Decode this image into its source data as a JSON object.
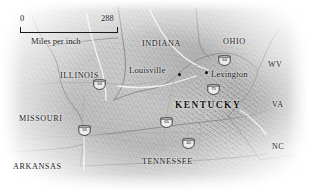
{
  "map": {
    "title": "Kentucky regional relief map",
    "scale_bar": {
      "min_label": "0",
      "max_label": "288",
      "caption": "Miles per inch"
    },
    "states": [
      {
        "id": "illinois",
        "label": "ILLINOIS",
        "x": 60,
        "y": 72
      },
      {
        "id": "indiana",
        "label": "INDIANA",
        "x": 142,
        "y": 40
      },
      {
        "id": "ohio",
        "label": "OHIO",
        "x": 223,
        "y": 38
      },
      {
        "id": "wv",
        "label": "WV",
        "x": 268,
        "y": 61
      },
      {
        "id": "va",
        "label": "VA",
        "x": 272,
        "y": 101
      },
      {
        "id": "nc",
        "label": "NC",
        "x": 272,
        "y": 143
      },
      {
        "id": "missouri",
        "label": "MISSOURI",
        "x": 19,
        "y": 115
      },
      {
        "id": "arkansas",
        "label": "ARKANSAS",
        "x": 13,
        "y": 163
      },
      {
        "id": "tennessee",
        "label": "TENNESSEE",
        "x": 142,
        "y": 158
      }
    ],
    "focus_state": {
      "id": "kentucky",
      "label": "KENTUCKY",
      "x": 175,
      "y": 101
    },
    "cities": [
      {
        "id": "louisville",
        "label": "Louisville",
        "label_x": 129,
        "label_y": 66,
        "dot_x": 178,
        "dot_y": 73
      },
      {
        "id": "lexington",
        "label": "Lexington",
        "label_x": 211,
        "label_y": 70,
        "dot_x": 205,
        "dot_y": 71
      }
    ],
    "interstate_shields": [
      {
        "id": "i64-illinois",
        "number": "64",
        "x": 93,
        "y": 79
      },
      {
        "id": "i64-kentucky",
        "number": "64",
        "x": 218,
        "y": 55
      },
      {
        "id": "i75-kentucky",
        "number": "75",
        "x": 207,
        "y": 84
      },
      {
        "id": "i65-kentucky",
        "number": "65",
        "x": 160,
        "y": 117
      },
      {
        "id": "i55-missouri",
        "number": "55",
        "x": 78,
        "y": 125
      },
      {
        "id": "i40-tennessee",
        "number": "40",
        "x": 182,
        "y": 138
      }
    ],
    "colors": {
      "land": "#c6c6c6",
      "ink": "#1d1d1d",
      "border_line": "#8a8a8a",
      "river": "#ffffff",
      "shield_fill": "#e9e9e9"
    }
  }
}
